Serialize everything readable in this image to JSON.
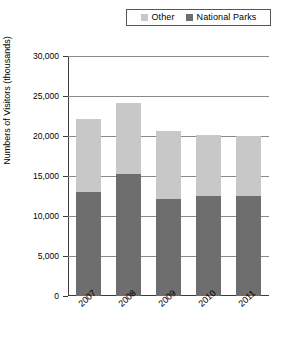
{
  "chart_data": {
    "type": "bar",
    "stacked": true,
    "title": "",
    "xlabel": "",
    "ylabel": "Numbers of Visitors (thousands)",
    "categories": [
      "2007",
      "2008",
      "2009",
      "2010",
      "2011"
    ],
    "series": [
      {
        "name": "National Parks",
        "color": "#6e6e6e",
        "values": [
          13000,
          15300,
          12100,
          12500,
          12500
        ]
      },
      {
        "name": "Other",
        "color": "#c8c8c8",
        "values": [
          9100,
          8800,
          8500,
          7650,
          7500
        ]
      }
    ],
    "totals": [
      22100,
      24100,
      20600,
      20150,
      20000
    ],
    "ylim": [
      0,
      30000
    ],
    "ytick_values": [
      0,
      5000,
      10000,
      15000,
      20000,
      25000,
      30000
    ],
    "ytick_labels": [
      "0",
      "5,000",
      "10,000",
      "15,000",
      "20,000",
      "25,000",
      "30,000"
    ],
    "grid": "horizontal",
    "legend_position": "top-center"
  },
  "legend": {
    "entries": [
      {
        "label": "Other",
        "color": "#c8c8c8"
      },
      {
        "label": "National Parks",
        "color": "#6e6e6e"
      }
    ]
  },
  "axes": {
    "y_title": "Numbers of Visitors (thousands)"
  },
  "caption": {
    "text": ""
  }
}
